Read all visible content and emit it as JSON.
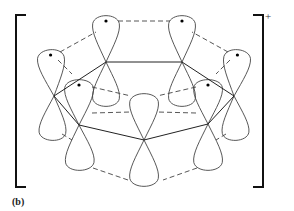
{
  "figure": {
    "label": "(b)",
    "charge": "+",
    "colors": {
      "line": "#444444",
      "bracket": "#111111",
      "dot": "#000000",
      "background": "#ffffff"
    },
    "brackets": {
      "left": {
        "x": 16,
        "top": 15,
        "bottom": 187,
        "serif": 10
      },
      "right": {
        "x": 263,
        "top": 15,
        "bottom": 187,
        "serif": -10
      }
    },
    "nodes": [
      {
        "id": "C1",
        "x": 106,
        "y": 62
      },
      {
        "id": "C2",
        "x": 182,
        "y": 62
      },
      {
        "id": "C3",
        "x": 54,
        "y": 96
      },
      {
        "id": "C4",
        "x": 234,
        "y": 96
      },
      {
        "id": "C5",
        "x": 79,
        "y": 125
      },
      {
        "id": "C6",
        "x": 208,
        "y": 124
      },
      {
        "id": "C7",
        "x": 144,
        "y": 140
      }
    ],
    "sigma_bonds": [
      [
        "C1",
        "C2"
      ],
      [
        "C1",
        "C3"
      ],
      [
        "C2",
        "C4"
      ],
      [
        "C3",
        "C5"
      ],
      [
        "C4",
        "C6"
      ],
      [
        "C5",
        "C7"
      ],
      [
        "C7",
        "C6"
      ]
    ],
    "lobes": [
      {
        "node": "C1",
        "tipx": 106,
        "tipy": 14,
        "w": 14,
        "dot": true
      },
      {
        "node": "C1",
        "tipx": 106,
        "tipy": 108,
        "w": 14,
        "dot": false
      },
      {
        "node": "C2",
        "tipx": 182,
        "tipy": 14,
        "w": 14,
        "dot": true
      },
      {
        "node": "C2",
        "tipx": 182,
        "tipy": 108,
        "w": 14,
        "dot": false
      },
      {
        "node": "C3",
        "tipx": 50,
        "tipy": 48,
        "w": 14,
        "dot": true
      },
      {
        "node": "C3",
        "tipx": 52,
        "tipy": 142,
        "w": 14,
        "dot": false
      },
      {
        "node": "C4",
        "tipx": 238,
        "tipy": 48,
        "w": 14,
        "dot": true
      },
      {
        "node": "C4",
        "tipx": 236,
        "tipy": 142,
        "w": 14,
        "dot": false
      },
      {
        "node": "C5",
        "tipx": 79,
        "tipy": 78,
        "w": 15,
        "dot": true
      },
      {
        "node": "C5",
        "tipx": 80,
        "tipy": 172,
        "w": 15,
        "dot": false
      },
      {
        "node": "C6",
        "tipx": 208,
        "tipy": 78,
        "w": 15,
        "dot": true
      },
      {
        "node": "C6",
        "tipx": 208,
        "tipy": 172,
        "w": 15,
        "dot": false
      },
      {
        "node": "C7",
        "tipx": 144,
        "tipy": 92,
        "w": 15,
        "dot": false
      },
      {
        "node": "C7",
        "tipx": 144,
        "tipy": 188,
        "w": 15,
        "dot": false
      }
    ],
    "pi_overlaps_dashed": [
      [
        [
          118,
          21
        ],
        [
          170,
          21
        ]
      ],
      [
        [
          60,
          52
        ],
        [
          96,
          32
        ]
      ],
      [
        [
          228,
          52
        ],
        [
          192,
          32
        ]
      ],
      [
        [
          58,
          60
        ],
        [
          72,
          74
        ]
      ],
      [
        [
          230,
          60
        ],
        [
          216,
          74
        ]
      ],
      [
        [
          92,
          87
        ],
        [
          131,
          96
        ]
      ],
      [
        [
          196,
          87
        ],
        [
          157,
          96
        ]
      ],
      [
        [
          92,
          113
        ],
        [
          131,
          112
        ]
      ],
      [
        [
          196,
          113
        ],
        [
          157,
          112
        ]
      ],
      [
        [
          93,
          168
        ],
        [
          128,
          180
        ]
      ],
      [
        [
          197,
          168
        ],
        [
          163,
          180
        ]
      ],
      [
        [
          62,
          134
        ],
        [
          72,
          140
        ]
      ],
      [
        [
          226,
          134
        ],
        [
          216,
          140
        ]
      ]
    ]
  }
}
